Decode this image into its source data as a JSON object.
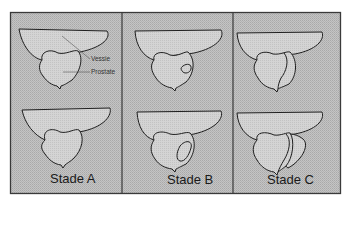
{
  "figure": {
    "background_color": "#bdbdbd",
    "frame_color": "#3a3a3a",
    "organ_fill": "#cfcfcf",
    "outline_color": "#1f1f1f",
    "annotations": {
      "bladder_label": "Vessie",
      "prostate_label": "Prostate"
    },
    "panels": [
      {
        "id": "A",
        "label": "Stade A",
        "tumor": "none"
      },
      {
        "id": "B",
        "label": "Stade B",
        "tumor": "nodule confined within prostate"
      },
      {
        "id": "C",
        "label": "Stade C",
        "tumor": "extension beyond prostatic capsule"
      }
    ]
  }
}
